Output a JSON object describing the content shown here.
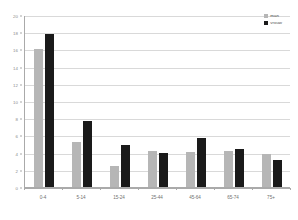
{
  "chart_data": {
    "type": "bar",
    "title": "",
    "subtitle": "",
    "xlabel": "",
    "ylabel": "",
    "ylim": [
      0,
      20
    ],
    "ytick_step": 2,
    "yticks": [
      "20",
      "18",
      "16",
      "14",
      "12",
      "10",
      "8",
      "6",
      "4",
      "2",
      "0"
    ],
    "grid": true,
    "legend_position": "top-right",
    "categories": [
      "0-4",
      "5-14",
      "15-24",
      "25-44",
      "45-64",
      "65-74",
      "75+"
    ],
    "series": [
      {
        "name": "man",
        "color": "#b6b6b6",
        "values": [
          16.1,
          5.2,
          2.5,
          4.2,
          4.1,
          4.2,
          3.8
        ]
      },
      {
        "name": "vrouw",
        "color": "#1a1a1a",
        "values": [
          17.8,
          7.7,
          4.9,
          3.9,
          5.7,
          4.4,
          3.1
        ]
      }
    ]
  },
  "legend": {
    "items": [
      {
        "label": "man",
        "swatch": "legend-swatch-man"
      },
      {
        "label": "vrouw",
        "swatch": "legend-swatch-vrouw"
      }
    ]
  },
  "colors": {
    "series_man": "#b6b6b6",
    "series_vrouw": "#1a1a1a",
    "gridline": "#d9d9d9",
    "axis": "#aaaaaa",
    "tick_text": "#8a8a8a",
    "background": "#ffffff"
  }
}
